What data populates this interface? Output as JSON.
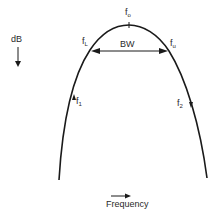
{
  "diagram": {
    "y_axis": {
      "label": "dB",
      "direction": "down"
    },
    "x_axis": {
      "label": "Frequency",
      "direction": "right"
    },
    "points": {
      "center": {
        "base": "f",
        "sub": "o"
      },
      "lower_cutoff": {
        "base": "f",
        "sub": "L"
      },
      "upper_cutoff": {
        "base": "f",
        "sub": "u"
      },
      "f1": {
        "base": "f",
        "sub": "1"
      },
      "f2": {
        "base": "f",
        "sub": "2"
      }
    },
    "bandwidth_label": "BW",
    "colors": {
      "line": "#1a1a1a",
      "background": "#ffffff"
    }
  }
}
